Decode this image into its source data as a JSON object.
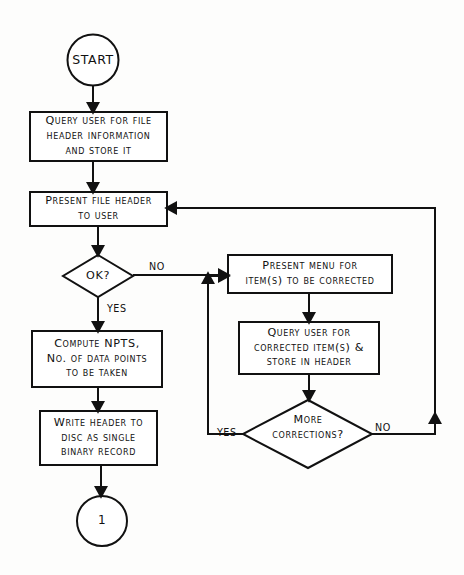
{
  "diagram": {
    "background_color": "#fdfdfc",
    "ink_color": "#111111",
    "nodes": {
      "start": {
        "shape": "terminator-circle",
        "label": "START"
      },
      "query_header": {
        "shape": "process",
        "lines": [
          "Query user for file",
          "header information",
          "and store it"
        ]
      },
      "present_header": {
        "shape": "process",
        "lines": [
          "Present file header",
          "to user"
        ]
      },
      "ok_decision": {
        "shape": "decision",
        "lines": [
          "OK?"
        ]
      },
      "compute_npts": {
        "shape": "process",
        "lines": [
          "Compute NPTS,",
          "No. of data points",
          "to be taken"
        ]
      },
      "write_header": {
        "shape": "process",
        "lines": [
          "Write header to",
          "disc as single",
          "binary record"
        ]
      },
      "connector_one": {
        "shape": "connector-circle",
        "label": "1"
      },
      "present_menu": {
        "shape": "process",
        "lines": [
          "Present menu for",
          "item(s) to be corrected"
        ]
      },
      "query_corrected": {
        "shape": "process",
        "lines": [
          "Query user for",
          "corrected item(s) &",
          "store in header"
        ]
      },
      "more_corrections": {
        "shape": "decision",
        "lines": [
          "More",
          "corrections?"
        ]
      }
    },
    "edge_labels": {
      "ok_no": "NO",
      "ok_yes": "YES",
      "more_yes": "YES",
      "more_no": "NO"
    }
  }
}
